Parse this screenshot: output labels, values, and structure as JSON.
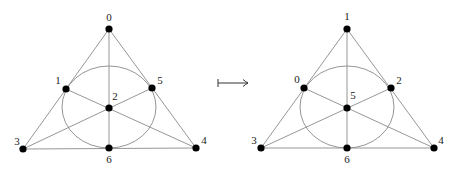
{
  "figures": [
    {
      "id": "left",
      "points": [
        {
          "label": "0",
          "x": 109,
          "y": 29,
          "lx": 109,
          "ly": 18
        },
        {
          "label": "1",
          "x": 66,
          "y": 89,
          "lx": 58,
          "ly": 81
        },
        {
          "label": "2",
          "x": 109,
          "y": 108,
          "lx": 115,
          "ly": 97
        },
        {
          "label": "3",
          "x": 23,
          "y": 149,
          "lx": 17,
          "ly": 142
        },
        {
          "label": "4",
          "x": 196,
          "y": 148,
          "lx": 204,
          "ly": 141
        },
        {
          "label": "5",
          "x": 152,
          "y": 88,
          "lx": 160,
          "ly": 81
        },
        {
          "label": "6",
          "x": 109,
          "y": 148,
          "lx": 109,
          "ly": 160
        }
      ],
      "circle": {
        "cx": 109,
        "cy": 107,
        "rx": 47,
        "ry": 41
      }
    },
    {
      "id": "right",
      "points": [
        {
          "label": "1",
          "x": 347,
          "y": 29,
          "lx": 347,
          "ly": 17
        },
        {
          "label": "0",
          "x": 304,
          "y": 88,
          "lx": 297,
          "ly": 80
        },
        {
          "label": "5",
          "x": 347,
          "y": 108,
          "lx": 353,
          "ly": 96
        },
        {
          "label": "3",
          "x": 261,
          "y": 148,
          "lx": 254,
          "ly": 141
        },
        {
          "label": "4",
          "x": 434,
          "y": 148,
          "lx": 441,
          "ly": 141
        },
        {
          "label": "2",
          "x": 391,
          "y": 88,
          "lx": 399,
          "ly": 81
        },
        {
          "label": "6",
          "x": 347,
          "y": 148,
          "lx": 347,
          "ly": 160
        }
      ],
      "circle": {
        "cx": 347,
        "cy": 107,
        "rx": 47,
        "ry": 41
      }
    }
  ],
  "mapsto": {
    "symbol": "⟼",
    "x1": 218,
    "x2": 248,
    "y": 83
  },
  "colors": {
    "node": "#000000",
    "line": "#8a8a8a",
    "label": "#222222"
  }
}
